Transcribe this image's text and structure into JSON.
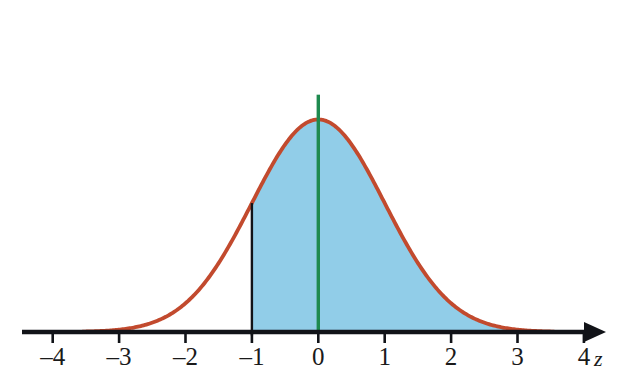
{
  "figure": {
    "axis_variable_label": "z",
    "background_color": "#ffffff"
  },
  "colors": {
    "curve": "#c24a2e",
    "fill": "#91cde8",
    "axis": "#111318",
    "marker_line": "#111318",
    "center_line": "#1e8a4f",
    "tick_label": "#1a1a1a"
  },
  "chart_data": {
    "type": "area",
    "title": "",
    "subtitle": "",
    "xlabel": "z",
    "ylabel": "",
    "grid": false,
    "legend_position": "none",
    "xlim": [
      -4.6,
      4.6
    ],
    "ylim": [
      0,
      0.44
    ],
    "x_ticks": [
      -4,
      -3,
      -2,
      -1,
      0,
      1,
      2,
      3,
      4
    ],
    "x_tick_labels": [
      "–4",
      "–3",
      "–2",
      "–1",
      "0",
      "1",
      "2",
      "3",
      "4"
    ],
    "y_ticks": [],
    "y_tick_labels": [],
    "curve": {
      "name": "standard normal density",
      "distribution": "normal",
      "mean": 0,
      "sd": 1,
      "peak_value": 0.3989,
      "drawn_x_range": [
        -3.55,
        3.55
      ],
      "x": [
        -3.5,
        -3.25,
        -3,
        -2.75,
        -2.5,
        -2.25,
        -2,
        -1.75,
        -1.5,
        -1.25,
        -1,
        -0.75,
        -0.5,
        -0.25,
        0,
        0.25,
        0.5,
        0.75,
        1,
        1.25,
        1.5,
        1.75,
        2,
        2.25,
        2.5,
        2.75,
        3,
        3.25,
        3.5
      ],
      "y": [
        0.0009,
        0.002,
        0.0044,
        0.0091,
        0.0175,
        0.0317,
        0.054,
        0.0863,
        0.1295,
        0.1826,
        0.242,
        0.3011,
        0.3521,
        0.3867,
        0.3989,
        0.3867,
        0.3521,
        0.3011,
        0.242,
        0.1826,
        0.1295,
        0.0863,
        0.054,
        0.0317,
        0.0175,
        0.0091,
        0.0044,
        0.002,
        0.0009
      ]
    },
    "shaded_region": {
      "label": "area to the right of z = -1",
      "x_from": -1,
      "x_to": 3.55,
      "area": 0.8413,
      "fill_color": "#91cde8"
    },
    "annotations": [
      {
        "name": "z-boundary-line",
        "type": "vertical-line",
        "x": -1,
        "y_from": 0,
        "y_to": 0.242,
        "color": "#111318"
      },
      {
        "name": "mean-center-line",
        "type": "vertical-line",
        "x": 0,
        "y_from": 0,
        "y_to": 0.4455,
        "color": "#1e8a4f"
      }
    ]
  },
  "tick_labels": [
    {
      "text": "–4",
      "value": -4
    },
    {
      "text": "–3",
      "value": -3
    },
    {
      "text": "–2",
      "value": -2
    },
    {
      "text": "–1",
      "value": -1
    },
    {
      "text": "0",
      "value": 0
    },
    {
      "text": "1",
      "value": 1
    },
    {
      "text": "2",
      "value": 2
    },
    {
      "text": "3",
      "value": 3
    },
    {
      "text": "4",
      "value": 4
    }
  ]
}
